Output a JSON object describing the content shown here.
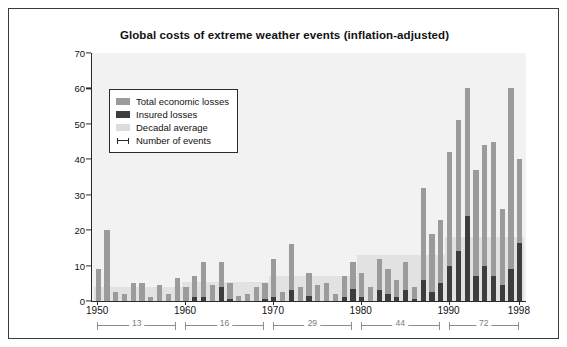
{
  "chart_data": {
    "type": "bar",
    "title": "Global costs of extreme weather events (inflation-adjusted)",
    "xlabel": "",
    "ylabel": "Annual losses, in thousand million U.S. dollars",
    "ylim": [
      0,
      70
    ],
    "ytick_values": [
      0,
      10,
      20,
      30,
      40,
      50,
      60,
      70
    ],
    "xtick_values": [
      1950,
      1960,
      1970,
      1980,
      1990,
      1998
    ],
    "xlim": [
      1949.3,
      1998.7
    ],
    "grid": false,
    "legend_position": "upper-left-inside",
    "legend": [
      {
        "label": "Total economic losses",
        "color": "#9b9b9b",
        "marker": "swatch"
      },
      {
        "label": "Insured losses",
        "color": "#3d3d3d",
        "marker": "swatch"
      },
      {
        "label": "Decadal average",
        "color": "#dcdcdc",
        "marker": "swatch"
      },
      {
        "label": "Number of events",
        "color": "#2b2b2b",
        "marker": "i-beam"
      }
    ],
    "x": [
      1950,
      1951,
      1952,
      1953,
      1954,
      1955,
      1956,
      1957,
      1958,
      1959,
      1960,
      1961,
      1962,
      1963,
      1964,
      1965,
      1966,
      1967,
      1968,
      1969,
      1970,
      1971,
      1972,
      1973,
      1974,
      1975,
      1976,
      1977,
      1978,
      1979,
      1980,
      1981,
      1982,
      1983,
      1984,
      1985,
      1986,
      1987,
      1988,
      1989,
      1990,
      1991,
      1992,
      1993,
      1994,
      1995,
      1996,
      1997,
      1998
    ],
    "series": [
      {
        "name": "Total economic losses",
        "color": "#9b9b9b",
        "values": [
          9,
          20,
          2.5,
          2,
          5,
          5,
          1,
          4.5,
          2,
          6.5,
          4,
          7,
          11,
          4.5,
          11,
          5,
          1.5,
          2,
          4,
          5,
          12,
          2.5,
          16,
          4,
          8,
          4.5,
          5,
          2,
          7,
          11,
          8,
          4,
          12,
          9,
          6,
          11,
          4,
          32,
          19,
          23,
          42,
          51,
          60,
          37,
          44,
          45,
          26,
          60,
          40
        ]
      },
      {
        "name": "Insured losses",
        "color": "#3d3d3d",
        "values": [
          0,
          0,
          0,
          0,
          0,
          0,
          0,
          0,
          0,
          0,
          0,
          1,
          1,
          0,
          4,
          0.5,
          0,
          0,
          0,
          0.5,
          1,
          0,
          3,
          0,
          1.5,
          0,
          0,
          0,
          1,
          3.5,
          1,
          0,
          3,
          2,
          1,
          3,
          0.5,
          6,
          2.5,
          5,
          10,
          14,
          24,
          7,
          10,
          7,
          4.5,
          9,
          16.5
        ]
      }
    ],
    "decadal_averages": [
      {
        "label": "1950s",
        "start": 1950,
        "end": 1959,
        "value": 4
      },
      {
        "label": "1960s",
        "start": 1960,
        "end": 1969,
        "value": 5.5
      },
      {
        "label": "1970s",
        "start": 1970,
        "end": 1979,
        "value": 7
      },
      {
        "label": "1980s",
        "start": 1980,
        "end": 1989,
        "value": 13
      },
      {
        "label": "1990s",
        "start": 1990,
        "end": 1998,
        "value": 18
      }
    ],
    "event_count_brackets": [
      {
        "count": "13",
        "start": 1950,
        "end": 1959
      },
      {
        "count": "16",
        "start": 1960,
        "end": 1969
      },
      {
        "count": "29",
        "start": 1970,
        "end": 1979
      },
      {
        "count": "44",
        "start": 1980,
        "end": 1989
      },
      {
        "count": "72",
        "start": 1990,
        "end": 1998
      }
    ]
  }
}
